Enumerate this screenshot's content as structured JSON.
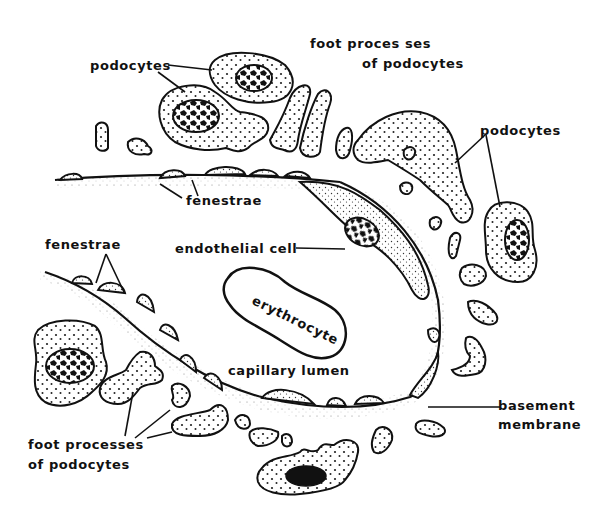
{
  "diagram": {
    "type": "glomerular capillary cross-section illustration",
    "labels": {
      "podocytes_top_left": "podocytes",
      "foot_processes_top_line1": "foot proces ses",
      "foot_processes_top_line2": "of podocytes",
      "podocytes_right": "podocytes",
      "fenestrae_top": "fenestrae",
      "endothelial_cell": "endothelial cell",
      "fenestrae_left": "fenestrae",
      "erythrocyte": "erythrocyte",
      "capillary_lumen": "capillary lumen",
      "basement_membrane_line1": "basement",
      "basement_membrane_line2": "membrane",
      "foot_processes_bottom_line1": "foot processes",
      "foot_processes_bottom_line2": "of podocytes"
    },
    "colors": {
      "ink": "#111111",
      "background": "#ffffff"
    }
  }
}
